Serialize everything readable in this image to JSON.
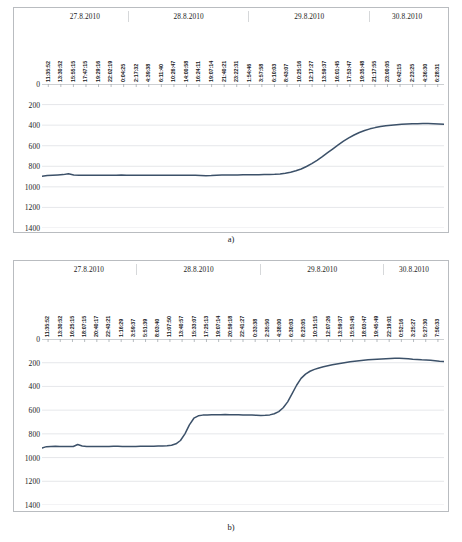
{
  "figures": [
    {
      "caption": "a)",
      "dates": [
        "27.8.2010",
        "28.8.2010",
        "29.8.2010",
        "30.8.2010"
      ],
      "chart_data": {
        "type": "line",
        "title": "",
        "xlabel": "",
        "ylabel": "",
        "ylim": [
          0,
          1400
        ],
        "y_inverted": true,
        "grid": true,
        "legend": "none",
        "line_color": "#3c5169",
        "yticks": [
          0,
          200,
          400,
          600,
          800,
          1000,
          1200,
          1400
        ],
        "date_groups": [
          {
            "label": "27.8.2010",
            "span": 0.215
          },
          {
            "label": "28.8.2010",
            "span": 0.3
          },
          {
            "label": "29.8.2010",
            "span": 0.3
          },
          {
            "label": "30.8.2010",
            "span": 0.185
          }
        ],
        "categories": [
          "11:35:52",
          "13:30:52",
          "15:55:15",
          "17:47:15",
          "19:29:16",
          "22:02:19",
          "0:04:25",
          "2:17:32",
          "4:39:38",
          "6:11:40",
          "10:26:47",
          "14:00:58",
          "16:24:11",
          "19:07:14",
          "21:40:21",
          "23:22:31",
          "1:54:46",
          "3:57:58",
          "6:10:03",
          "8:43:07",
          "10:25:16",
          "12:17:27",
          "13:59:37",
          "16:01:45",
          "17:53:47",
          "19:35:48",
          "21:17:55",
          "23:00:05",
          "0:42:15",
          "2:23:25",
          "4:36:30",
          "6:28:31"
        ],
        "values": [
          898,
          890,
          886,
          884,
          881,
          872,
          884,
          886,
          886,
          886,
          887,
          886,
          886,
          886,
          886,
          885,
          886,
          886,
          886,
          887,
          888,
          888,
          888,
          887,
          886,
          886,
          886,
          886,
          886,
          887,
          890,
          892,
          890,
          886,
          885,
          884,
          884,
          884,
          883,
          883,
          882,
          882,
          881,
          880,
          878,
          874,
          868,
          858,
          844,
          826,
          802,
          774,
          742,
          706,
          668,
          630,
          592,
          556,
          524,
          496,
          472,
          452,
          436,
          424,
          414,
          406,
          400,
          396,
          392,
          389,
          387,
          386,
          385,
          385,
          386,
          388,
          392
        ]
      }
    },
    {
      "caption": "b)",
      "dates": [
        "27.8.2010",
        "28.8.2010",
        "29.8.2010",
        "30.8.2010"
      ],
      "chart_data": {
        "type": "line",
        "title": "",
        "xlabel": "",
        "ylabel": "",
        "ylim": [
          0,
          1400
        ],
        "y_inverted": true,
        "grid": true,
        "legend": "none",
        "line_color": "#3c5169",
        "yticks": [
          0,
          200,
          400,
          600,
          800,
          1000,
          1200,
          1400
        ],
        "date_groups": [
          {
            "label": "27.8.2010",
            "span": 0.235
          },
          {
            "label": "28.8.2010",
            "span": 0.31
          },
          {
            "label": "29.8.2010",
            "span": 0.305
          },
          {
            "label": "30.8.2010",
            "span": 0.15
          }
        ],
        "categories": [
          "11:35:52",
          "13:30:52",
          "16:25:15",
          "18:07:15",
          "20:40:17",
          "22:43:21",
          "1:16:29",
          "3:59:37",
          "5:51:39",
          "8:03:40",
          "11:07:50",
          "13:40:57",
          "15:33:07",
          "17:25:13",
          "19:07:14",
          "20:59:18",
          "22:41:27",
          "0:33:38",
          "2:35:50",
          "4:38:00",
          "6:30:03",
          "8:23:05",
          "10:15:15",
          "12:07:26",
          "13:59:37",
          "15:51:45",
          "18:03:47",
          "19:45:49",
          "22:19:01",
          "0:52:16",
          "3:25:27",
          "5:27:30",
          "7:50:33"
        ],
        "values": [
          920,
          908,
          906,
          905,
          906,
          906,
          907,
          907,
          890,
          902,
          906,
          906,
          906,
          906,
          906,
          906,
          905,
          905,
          906,
          906,
          906,
          906,
          905,
          905,
          905,
          904,
          903,
          902,
          900,
          896,
          884,
          856,
          800,
          724,
          668,
          648,
          642,
          640,
          639,
          638,
          638,
          637,
          638,
          639,
          639,
          640,
          641,
          642,
          644,
          646,
          644,
          640,
          630,
          612,
          580,
          530,
          460,
          390,
          332,
          296,
          272,
          256,
          244,
          234,
          226,
          218,
          210,
          204,
          198,
          192,
          188,
          184,
          180,
          176,
          172,
          170,
          168,
          166,
          164,
          163,
          162,
          164,
          166,
          170,
          172,
          176,
          178,
          180,
          184,
          188,
          190
        ]
      }
    }
  ]
}
